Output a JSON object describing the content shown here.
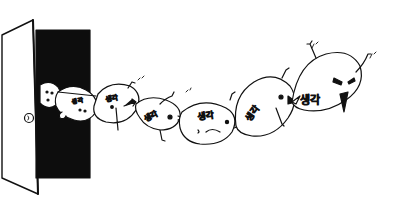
{
  "illustration": {
    "style": "hand-drawn ink sketch",
    "background_color": "#ffffff",
    "ink_color": "#111111",
    "doorway_color": "#0d0d0d",
    "creature_label": "생각",
    "creatures": [
      {
        "id": 1,
        "label": "생각",
        "expression": "peeking"
      },
      {
        "id": 2,
        "label": "생각",
        "expression": "neutral"
      },
      {
        "id": 3,
        "label": "생각",
        "expression": "neutral"
      },
      {
        "id": 4,
        "label": "생각",
        "expression": "neutral"
      },
      {
        "id": 5,
        "label": "생각",
        "expression": "frowning"
      },
      {
        "id": 6,
        "label": "생각",
        "expression": "shouting"
      },
      {
        "id": 7,
        "label": "생각",
        "expression": "angry"
      }
    ]
  }
}
